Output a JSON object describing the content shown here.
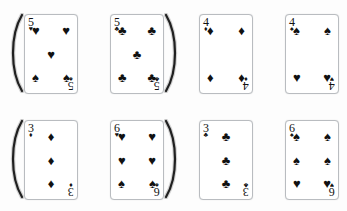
{
  "scan": {
    "title": "Playing card scan sheet",
    "background_color": "#fdfdfd",
    "card_border_color": "#b9bcc0",
    "ink_color": "#111111",
    "columns": 4,
    "rows": 2,
    "card_count": 8
  },
  "glyphs": {
    "heart": "♥",
    "spade": "♠",
    "club": "♣",
    "diamond": "♦"
  },
  "cards": [
    {
      "id": "card-1",
      "rank": "5",
      "corner_top_suit": "heart",
      "corner_bottom_suit": "spade",
      "suits_present": [
        "heart",
        "spade"
      ],
      "mixed_suit": true,
      "pip_rows": [
        [
          "heart",
          "heart"
        ],
        [
          "heart"
        ],
        [
          "spade",
          "spade"
        ]
      ],
      "curl_side": "left"
    },
    {
      "id": "card-2",
      "rank": "5",
      "corner_top_suit": "club",
      "corner_bottom_suit": "club",
      "suits_present": [
        "club"
      ],
      "mixed_suit": false,
      "pip_rows": [
        [
          "club",
          "club"
        ],
        [
          "club"
        ],
        [
          "club",
          "club"
        ]
      ],
      "curl_side": "right"
    },
    {
      "id": "card-3",
      "rank": "4",
      "corner_top_suit": "diamond",
      "corner_bottom_suit": "diamond",
      "suits_present": [
        "diamond"
      ],
      "mixed_suit": false,
      "pip_rows": [
        [
          "diamond",
          "diamond"
        ],
        [],
        [
          "diamond",
          "diamond"
        ]
      ],
      "curl_side": "none"
    },
    {
      "id": "card-4",
      "rank": "4",
      "corner_top_suit": "spade",
      "corner_bottom_suit": "heart",
      "suits_present": [
        "spade",
        "heart"
      ],
      "mixed_suit": true,
      "pip_rows": [
        [
          "spade",
          "spade"
        ],
        [],
        [
          "heart",
          "heart"
        ]
      ],
      "curl_side": "none"
    },
    {
      "id": "card-5",
      "rank": "3",
      "corner_top_suit": "diamond",
      "corner_bottom_suit": "diamond",
      "suits_present": [
        "diamond"
      ],
      "mixed_suit": false,
      "pip_rows": [
        [
          "diamond"
        ],
        [
          "diamond"
        ],
        [
          "diamond"
        ]
      ],
      "curl_side": "left"
    },
    {
      "id": "card-6",
      "rank": "6",
      "corner_top_suit": "heart",
      "corner_bottom_suit": "spade",
      "suits_present": [
        "heart",
        "spade"
      ],
      "mixed_suit": true,
      "pip_rows": [
        [
          "heart",
          "heart"
        ],
        [
          "heart",
          "heart"
        ],
        [
          "spade",
          "spade"
        ]
      ],
      "curl_side": "right"
    },
    {
      "id": "card-7",
      "rank": "3",
      "corner_top_suit": "club",
      "corner_bottom_suit": "club",
      "suits_present": [
        "club"
      ],
      "mixed_suit": false,
      "pip_rows": [
        [
          "club"
        ],
        [
          "club"
        ],
        [
          "club"
        ]
      ],
      "curl_side": "none"
    },
    {
      "id": "card-8",
      "rank": "6",
      "corner_top_suit": "spade",
      "corner_bottom_suit": "heart",
      "suits_present": [
        "spade",
        "heart"
      ],
      "mixed_suit": true,
      "pip_rows": [
        [
          "spade",
          "spade"
        ],
        [
          "spade",
          "spade"
        ],
        [
          "heart",
          "heart"
        ]
      ],
      "curl_side": "none"
    }
  ]
}
